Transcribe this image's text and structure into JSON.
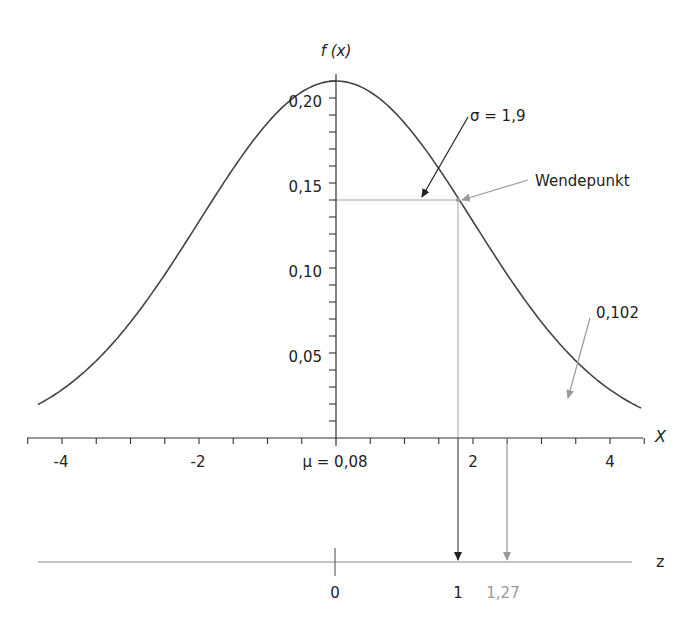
{
  "chart_data": {
    "type": "line",
    "title": "",
    "subtitle": "",
    "xlabel": "X",
    "ylabel": "f (x)",
    "distribution": "normal",
    "mu": 0.08,
    "sigma": 1.9,
    "peak_density": 0.21,
    "xlim": [
      -4.4,
      4.4
    ],
    "ylim": [
      0,
      0.22
    ],
    "x_ticks": [
      -4,
      -2,
      2,
      4
    ],
    "x_tick_labels": [
      "-4",
      "-2",
      "2",
      "4"
    ],
    "x_minor_step": 0.5,
    "y_ticks": [
      0.05,
      0.1,
      0.15,
      0.2
    ],
    "y_tick_labels": [
      "0,05",
      "0,10",
      "0,15",
      "0,20"
    ],
    "y_minor_step": 0.01,
    "grid": false,
    "legend": null,
    "series": [
      {
        "name": "f(x)",
        "x": [
          -4.3,
          -3,
          -2,
          -1,
          0,
          1,
          1.8,
          2,
          3,
          4.5
        ],
        "y": [
          0.012,
          0.04,
          0.085,
          0.16,
          0.211,
          0.17,
          0.14,
          0.12,
          0.06,
          0.012
        ]
      }
    ],
    "annotations": [
      {
        "text": "σ = 1,9",
        "type": "arrow",
        "target": "horizontal line from mean to inflection point",
        "color": "#222222"
      },
      {
        "text": "Wendepunkt",
        "type": "arrow",
        "target": "inflection point (≈1.8, 0.14)",
        "color": "#9a9a9a"
      },
      {
        "text": "0,102",
        "type": "arrow",
        "target": "area under right tail",
        "color": "#9a9a9a"
      },
      {
        "text": "μ = 0,08",
        "type": "label",
        "position": "x-axis origin"
      }
    ],
    "z_axis": {
      "label": "z",
      "ticks": [
        "0"
      ],
      "marked_values": [
        {
          "value": "1",
          "color": "#222222"
        },
        {
          "value": "1,27",
          "color": "#9a9a9a"
        }
      ]
    }
  },
  "labels": {
    "y_axis_title": "f (x)",
    "x_axis_title": "X",
    "z_axis_title": "z",
    "sigma": "σ = 1,9",
    "wendepunkt": "Wendepunkt",
    "area": "0,102",
    "mu": "μ = 0,08",
    "z0": "0",
    "z1": "1",
    "z127": "1,27"
  },
  "colors": {
    "curve": "#444444",
    "axis": "#333333",
    "guide": "#a8a8a8",
    "annotation_dark": "#222222",
    "annotation_grey": "#9a9a9a"
  }
}
